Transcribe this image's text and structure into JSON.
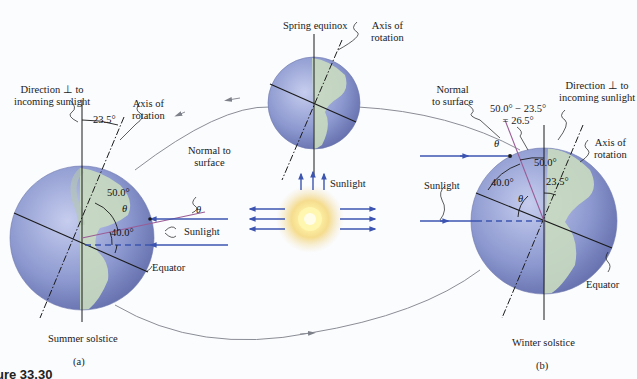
{
  "figure": {
    "caption_fragment": "ure 33.30",
    "panel_a": {
      "tag": "(a)",
      "title": "Summer solstice",
      "direction_label_line1": "Direction ⊥ to",
      "direction_label_line2": "incoming sunlight",
      "axis_label_line1": "Axis of",
      "axis_label_line2": "rotation",
      "axis_tilt": "23.5°",
      "normal_label_line1": "Normal to",
      "normal_label_line2": "surface",
      "angle_50": "50.0°",
      "angle_40": "40.0°",
      "theta": "θ",
      "sunlight_label": "Sunlight",
      "equator_label": "Equator"
    },
    "center": {
      "title": "Spring equinox",
      "axis_label_line1": "Axis of",
      "axis_label_line2": "rotation",
      "sunlight_label": "Sunlight"
    },
    "panel_b": {
      "tag": "(b)",
      "title": "Winter solstice",
      "direction_label_line1": "Direction ⊥ to",
      "direction_label_line2": "incoming sunlight",
      "axis_label_line1": "Axis of",
      "axis_label_line2": "rotation",
      "normal_label_line1": "Normal",
      "normal_label_line2": "to surface",
      "diff_line1": "50.0° − 23.5°",
      "diff_line2": "= 26.5°",
      "angle_50": "50.0°",
      "angle_40": "40.0°",
      "axis_tilt": "23.5°",
      "theta": "θ",
      "sunlight_label": "Sunlight",
      "equator_label": "Equator"
    },
    "colors": {
      "ocean": "#8e9bd0",
      "land": "#c9dcc0",
      "sun_core": "#fff6b0",
      "sun_glow": "#f3d98a",
      "sun_ray": "#3d55b0",
      "normal_line": "#9a5c95",
      "orbit": "#8a8d95"
    }
  }
}
